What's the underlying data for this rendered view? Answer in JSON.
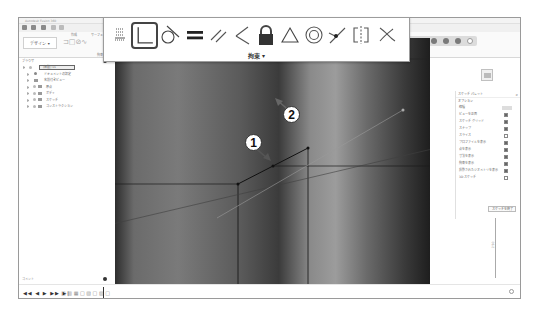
{
  "window": {
    "title": "Autodesk Fusion 360"
  },
  "quick_access": {
    "buttons": [
      "grid-menu",
      "file-menu",
      "save",
      "undo",
      "redo"
    ]
  },
  "ribbon": {
    "workspace_label": "デザイン ▾",
    "groups": [
      {
        "label": "作成"
      },
      {
        "label": "サーフェス"
      },
      {
        "label": "拘束 ▾"
      }
    ],
    "right_toolbar_icons": [
      "account",
      "notifications",
      "help",
      "extensions",
      "profile"
    ]
  },
  "browser": {
    "title": "ブラウザ",
    "root": {
      "label": "(無題) v1"
    },
    "items": [
      {
        "label": "ドキュメントの設定",
        "icon": "gear"
      },
      {
        "label": "名前付きビュー",
        "icon": "folder"
      },
      {
        "label": "原点",
        "icon": "folder"
      },
      {
        "label": "ボディ",
        "icon": "folder"
      },
      {
        "label": "スケッチ",
        "icon": "folder"
      },
      {
        "label": "コンストラクション",
        "icon": "folder"
      }
    ]
  },
  "comments": {
    "title": "コメント"
  },
  "constraint_panel": {
    "label": "拘束 ▾",
    "tools": [
      {
        "name": "fix-unfix",
        "tooltip": "固定/固定解除"
      },
      {
        "name": "perpendicular",
        "tooltip": "直交",
        "active": true
      },
      {
        "name": "tangent",
        "tooltip": "正接"
      },
      {
        "name": "equal",
        "tooltip": "同一"
      },
      {
        "name": "parallel",
        "tooltip": "平行"
      },
      {
        "name": "perpendicular-alt",
        "tooltip": "直角"
      },
      {
        "name": "lock",
        "tooltip": "固定"
      },
      {
        "name": "coincident-triangle",
        "tooltip": "一致"
      },
      {
        "name": "concentric",
        "tooltip": "同心円"
      },
      {
        "name": "midpoint",
        "tooltip": "中点"
      },
      {
        "name": "symmetry",
        "tooltip": "対称"
      },
      {
        "name": "curvature",
        "tooltip": "曲率"
      }
    ]
  },
  "canvas": {
    "callouts": [
      {
        "number": "1"
      },
      {
        "number": "2"
      }
    ],
    "nav_bar_icons": [
      "orbit",
      "pan",
      "look-at",
      "zoom",
      "fit",
      "display",
      "grid",
      "viewports"
    ]
  },
  "sketch_palette": {
    "title": "スケッチ パレット",
    "section": "オプション",
    "rows": [
      {
        "label": "線種",
        "control": "segmented"
      },
      {
        "label": "ビューを正面",
        "checked": true
      },
      {
        "label": "スケッチ グリッド",
        "checked": true
      },
      {
        "label": "スナップ",
        "checked": true
      },
      {
        "label": "スライス",
        "checked": false
      },
      {
        "label": "プロファイルを表示",
        "checked": true
      },
      {
        "label": "点を表示",
        "checked": true
      },
      {
        "label": "寸法を表示",
        "checked": true
      },
      {
        "label": "拘束を表示",
        "checked": true
      },
      {
        "label": "投影されたジオメトリを表示",
        "checked": true
      },
      {
        "label": "3D スケッチ",
        "checked": false
      }
    ],
    "finish_button": "スケッチを終了"
  },
  "dimension": {
    "value": "2.50"
  },
  "timeline": {
    "controls": "◀◀ ◀ ▶ ▶▶ ▶|",
    "features": "□ ▥ ▦ □ ▧ □ ▨ □"
  }
}
